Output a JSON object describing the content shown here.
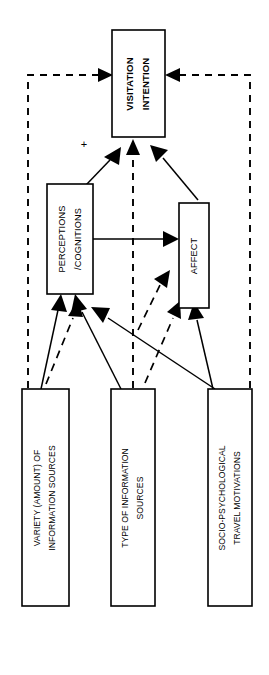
{
  "diagram": {
    "orientation": "rotated-90-counterclockwise",
    "background_color": "#ffffff",
    "line_color": "#000000",
    "nodes": {
      "visitation_intention": {
        "label_line1": "VISITATION",
        "label_line2": "INTENTION",
        "weight": "bold"
      },
      "perceptions_cognitions": {
        "label_line1": "PERCEPTIONS",
        "label_line2": "/COGNITIONS",
        "weight": "normal"
      },
      "affect": {
        "label_line1": "AFFECT",
        "label_line2": "",
        "weight": "normal"
      },
      "variety_of_information_sources": {
        "label_line1": "VARIETY (AMOUNT) OF",
        "label_line2": "INFORMATION SOURCES",
        "weight": "normal"
      },
      "type_of_information_sources": {
        "label_line1": "TYPE OF INFORMATION",
        "label_line2": "SOURCES",
        "weight": "normal"
      },
      "socio_psychological_travel_motivations": {
        "label_line1": "SOCIO-PSYCHOLOGICAL",
        "label_line2": "TRAVEL MOTIVATIONS",
        "weight": "normal"
      }
    },
    "annotations": {
      "positive_sign": "+"
    },
    "edge_legend": {
      "solid": "direct effect",
      "dashed": "moderating / indirect effect"
    }
  }
}
